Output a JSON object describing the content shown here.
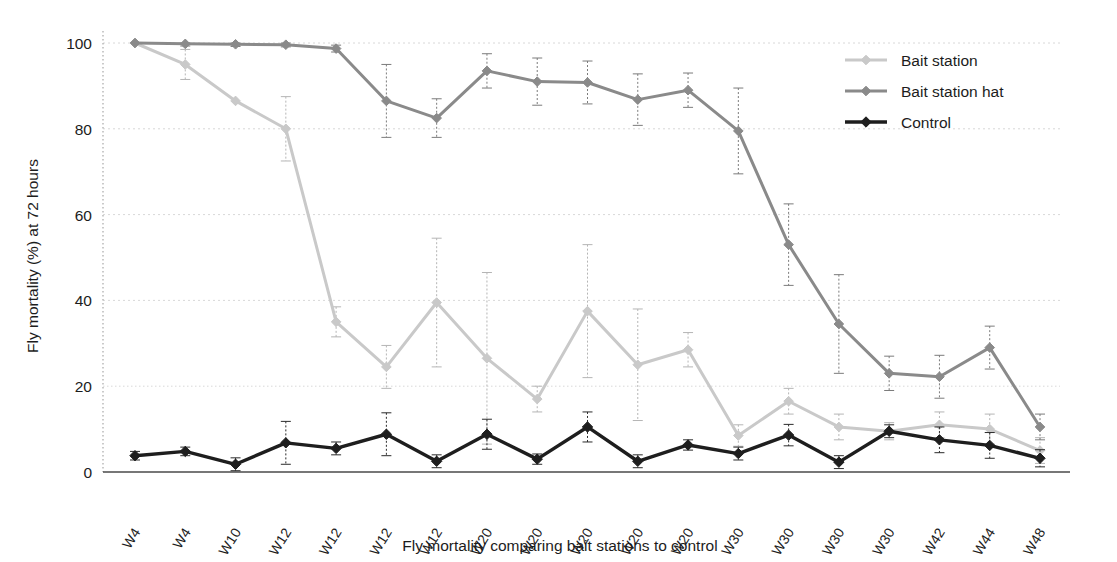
{
  "chart_data": {
    "type": "line",
    "title": "",
    "xlabel": "Fly mortality comparing bait stations to control",
    "ylabel": "Fly mortality (%) at 72 hours",
    "ylim": [
      0,
      100
    ],
    "yticks": [
      0,
      20,
      40,
      60,
      80,
      100
    ],
    "grid": true,
    "legend_position": "top-right",
    "categories": [
      "W4",
      "W4",
      "W10",
      "W12",
      "W12",
      "W12",
      "W12",
      "W20",
      "W20",
      "W20",
      "W20",
      "W20",
      "W30",
      "W30",
      "W30",
      "W30",
      "W42",
      "W44",
      "W48"
    ],
    "series": [
      {
        "name": "Bait station",
        "color": "#c9c9c9",
        "values": [
          100,
          95,
          86.5,
          80,
          35,
          24.5,
          39.5,
          26.5,
          17,
          37.5,
          25,
          28.5,
          8.5,
          16.5,
          10.5,
          9.5,
          11,
          10,
          5
        ],
        "errors": [
          0,
          3.5,
          0,
          7.5,
          3.5,
          5,
          15,
          20,
          3,
          15.5,
          13,
          4,
          2.5,
          3,
          3,
          2,
          3,
          3.5,
          3
        ]
      },
      {
        "name": "Bait station hat",
        "color": "#8a8a8a",
        "values": [
          100,
          99.8,
          99.7,
          99.6,
          98.7,
          86.5,
          82.5,
          93.5,
          91,
          90.8,
          86.8,
          89,
          79.5,
          53,
          34.5,
          23,
          22.2,
          29,
          10.5
        ],
        "errors": [
          0,
          0.5,
          0.5,
          0.5,
          0.8,
          8.5,
          4.5,
          4,
          5.5,
          5,
          6,
          4,
          10,
          9.5,
          11.5,
          4,
          5,
          5,
          3
        ]
      },
      {
        "name": "Control",
        "color": "#1e1e1e",
        "values": [
          3.8,
          4.8,
          1.8,
          6.8,
          5.5,
          8.8,
          2.5,
          8.8,
          3,
          10.5,
          2.5,
          6.3,
          4.3,
          8.6,
          2.3,
          9.5,
          7.5,
          6.2,
          3.2
        ],
        "errors": [
          1,
          1,
          1.5,
          5,
          1.5,
          5,
          1.5,
          3.5,
          1.2,
          3.5,
          1.5,
          1.2,
          1.5,
          2.5,
          1.5,
          1.5,
          3,
          3,
          2
        ]
      }
    ],
    "legend": [
      {
        "label": "Bait station",
        "color": "#c9c9c9"
      },
      {
        "label": "Bait station hat",
        "color": "#8a8a8a"
      },
      {
        "label": "Control",
        "color": "#1e1e1e"
      }
    ]
  },
  "axes": {
    "y_tick_labels": [
      "100",
      "80",
      "60",
      "40",
      "20",
      "0"
    ],
    "y_axis_title": "Fly mortality (%) at 72 hours",
    "x_axis_title": "Fly mortality comparing bait stations to control"
  }
}
